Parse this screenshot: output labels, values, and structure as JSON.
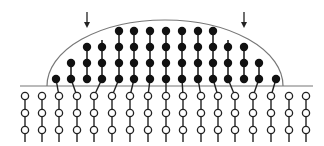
{
  "diagram": {
    "colors": {
      "background": "#ffffff",
      "stroke": "#222222",
      "surface_line": "#777777",
      "filled_node": "#111111",
      "open_node_fill": "#ffffff"
    },
    "surface_line": {
      "x1": 20,
      "x2": 313,
      "y": 86
    },
    "dome": {
      "x_start": 47,
      "x_end": 283,
      "y_base": 86,
      "peak_y": 20,
      "peak_x": 165
    },
    "arrows": [
      {
        "x": 87,
        "y1": 12,
        "y2": 28
      },
      {
        "x": 244,
        "y1": 12,
        "y2": 28
      }
    ],
    "filled_rows_y": [
      31,
      47,
      63,
      79
    ],
    "filled_columns": [
      {
        "x": 56,
        "count": 1,
        "stem_top": 79,
        "link_to": 59
      },
      {
        "x": 71,
        "count": 2,
        "stem_top": 63,
        "link_to": 77
      },
      {
        "x": 87,
        "count": 3,
        "stem_top": 47,
        "link_to": null
      },
      {
        "x": 102,
        "count": 3,
        "stem_top": 40,
        "link_to": 94
      },
      {
        "x": 119,
        "count": 4,
        "stem_top": 31,
        "link_to": 112
      },
      {
        "x": 134,
        "count": 4,
        "stem_top": 27,
        "link_to": 130
      },
      {
        "x": 150,
        "count": 4,
        "stem_top": 27,
        "link_to": 148
      },
      {
        "x": 166,
        "count": 4,
        "stem_top": 31,
        "link_to": 166
      },
      {
        "x": 182,
        "count": 4,
        "stem_top": 31,
        "link_to": 183
      },
      {
        "x": 198,
        "count": 4,
        "stem_top": 31,
        "link_to": 201
      },
      {
        "x": 213,
        "count": 4,
        "stem_top": 31,
        "link_to": 218
      },
      {
        "x": 228,
        "count": 3,
        "stem_top": 40,
        "link_to": 235
      },
      {
        "x": 244,
        "count": 3,
        "stem_top": 47,
        "link_to": null
      },
      {
        "x": 259,
        "count": 2,
        "stem_top": 63,
        "link_to": 253
      },
      {
        "x": 276,
        "count": 1,
        "stem_top": 79,
        "link_to": 271
      }
    ],
    "open_rows_y": [
      96,
      113,
      130
    ],
    "open_tail_y": 142,
    "open_columns_x": [
      25,
      42,
      59,
      77,
      94,
      112,
      130,
      148,
      166,
      183,
      201,
      218,
      235,
      253,
      271,
      289,
      306
    ]
  }
}
